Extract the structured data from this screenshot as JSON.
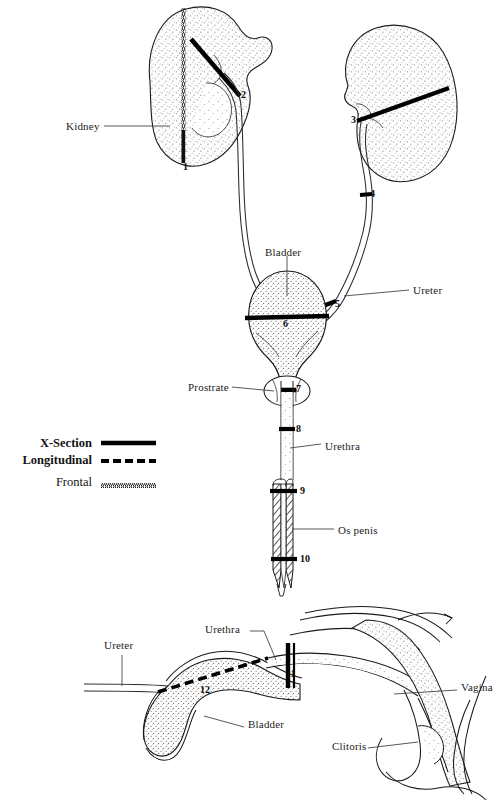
{
  "figure": {
    "background_color": "#ffffff",
    "ink_color": "#1a1a1a",
    "stipple_color": "#777777"
  },
  "legend": {
    "entries": [
      {
        "label": "X-Section",
        "style": "solid-thick",
        "swatch_name": "x-section-swatch"
      },
      {
        "label": "Longitudinal",
        "style": "dashed-slant",
        "swatch_name": "longitudinal-swatch"
      },
      {
        "label": "Frontal",
        "style": "fine-zigzag",
        "swatch_name": "frontal-swatch"
      }
    ]
  },
  "upper_panel": {
    "name": "male-urinary-tract",
    "labels": [
      {
        "text": "Kidney",
        "x": 66,
        "y": 120,
        "leader_to_x": 168,
        "leader_to_y": 128
      },
      {
        "text": "Bladder",
        "x": 265,
        "y": 246,
        "leader_to_x": 287,
        "leader_to_y": 296
      },
      {
        "text": "Ureter",
        "x": 413,
        "y": 284,
        "leader_to_x": 340,
        "leader_to_y": 292
      },
      {
        "text": "Prostrate",
        "x": 188,
        "y": 381,
        "leader_to_x": 272,
        "leader_to_y": 390
      },
      {
        "text": "Urethra",
        "x": 325,
        "y": 440,
        "leader_to_x": 290,
        "leader_to_y": 448
      },
      {
        "text": "Os penis",
        "x": 338,
        "y": 525,
        "leader_to_x": 297,
        "leader_to_y": 528
      }
    ],
    "section_markers": [
      {
        "number": "1",
        "type": "frontal",
        "x": 186,
        "y": 166
      },
      {
        "number": "2",
        "type": "x-section",
        "x": 243,
        "y": 95
      },
      {
        "number": "3",
        "type": "x-section",
        "x": 355,
        "y": 120
      },
      {
        "number": "4",
        "type": "x-section",
        "x": 371,
        "y": 196
      },
      {
        "number": "5",
        "type": "x-section",
        "x": 336,
        "y": 306
      },
      {
        "number": "6",
        "type": "x-section",
        "x": 285,
        "y": 322
      },
      {
        "number": "7",
        "type": "x-section",
        "x": 296,
        "y": 389
      },
      {
        "number": "8",
        "type": "x-section",
        "x": 296,
        "y": 429
      },
      {
        "number": "9",
        "type": "x-section",
        "x": 301,
        "y": 491
      },
      {
        "number": "10",
        "type": "x-section",
        "x": 301,
        "y": 559
      }
    ]
  },
  "lower_panel": {
    "name": "female-urinary-tract",
    "labels": [
      {
        "text": "Ureter",
        "x": 105,
        "y": 645,
        "leader_to_x": 122,
        "leader_to_y": 688
      },
      {
        "text": "Urethra",
        "x": 206,
        "y": 627,
        "leader_to_x": 268,
        "leader_to_y": 657
      },
      {
        "text": "Vagina",
        "x": 461,
        "y": 686,
        "leader_to_x": 395,
        "leader_to_y": 690
      },
      {
        "text": "Bladder",
        "x": 248,
        "y": 723,
        "leader_to_x": 200,
        "leader_to_y": 713
      },
      {
        "text": "Clitoris",
        "x": 332,
        "y": 744,
        "leader_to_x": 407,
        "leader_to_y": 738
      }
    ],
    "section_markers": [
      {
        "number": "11",
        "type": "x-section",
        "x": 291,
        "y": 673
      },
      {
        "number": "12",
        "type": "longitudinal",
        "x": 203,
        "y": 690
      }
    ]
  }
}
